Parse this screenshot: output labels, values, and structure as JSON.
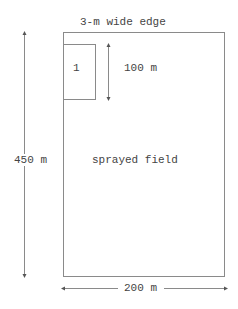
{
  "diagram": {
    "edge_label": "3-m wide edge",
    "plot_label": "1",
    "plot_height_label": "100 m",
    "field_height_label": "450 m",
    "field_label": "sprayed field",
    "field_width_label": "200 m"
  },
  "colors": {
    "line": "#8a8a8a",
    "text": "#444444",
    "background": "#ffffff"
  }
}
